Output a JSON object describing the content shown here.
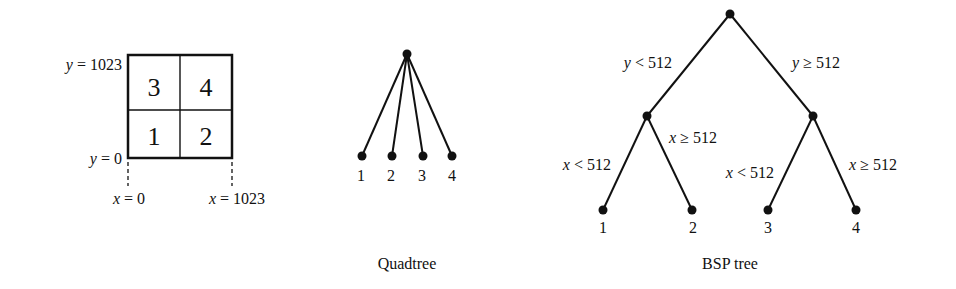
{
  "grid": {
    "cells": [
      {
        "label": "3",
        "row": 0,
        "col": 0
      },
      {
        "label": "4",
        "row": 0,
        "col": 1
      },
      {
        "label": "1",
        "row": 1,
        "col": 0
      },
      {
        "label": "2",
        "row": 1,
        "col": 1
      }
    ],
    "y_top": {
      "var": "y",
      "text": " = 1023"
    },
    "y_bottom": {
      "var": "y",
      "text": " = 0"
    },
    "x_left": {
      "var": "x",
      "text": " = 0"
    },
    "x_right": {
      "var": "x",
      "text": " = 1023"
    }
  },
  "quadtree": {
    "caption": "Quadtree",
    "leaves": [
      "1",
      "2",
      "3",
      "4"
    ]
  },
  "bsp": {
    "caption": "BSP tree",
    "root_left_edge": {
      "var": "y",
      "text": " < 512"
    },
    "root_right_edge": {
      "var": "y",
      "text": " ≥ 512"
    },
    "left_left_edge": {
      "var": "x",
      "text": " < 512"
    },
    "left_right_edge": {
      "var": "x",
      "text": " ≥ 512"
    },
    "right_left_edge": {
      "var": "x",
      "text": " < 512"
    },
    "right_right_edge": {
      "var": "x",
      "text": " ≥ 512"
    },
    "leaves": [
      "1",
      "2",
      "3",
      "4"
    ]
  }
}
